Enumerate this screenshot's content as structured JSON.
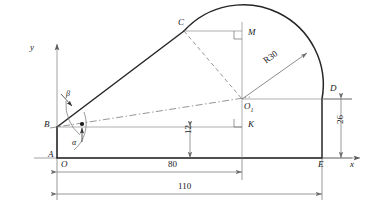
{
  "drawing": {
    "title": "Cam profile geometric construction",
    "axes": {
      "x_label": "x",
      "y_label": "y",
      "origin_label": "O"
    },
    "points": [
      {
        "id": "A",
        "label": "A",
        "x": 48,
        "y": 150
      },
      {
        "id": "B",
        "label": "B",
        "x": 44,
        "y": 120
      },
      {
        "id": "C",
        "label": "C",
        "x": 178,
        "y": 18
      },
      {
        "id": "M",
        "label": "M",
        "x": 248,
        "y": 28
      },
      {
        "id": "O1",
        "label": "O",
        "sub": "1",
        "x": 244,
        "y": 102
      },
      {
        "id": "K",
        "label": "K",
        "x": 248,
        "y": 120
      },
      {
        "id": "D",
        "label": "D",
        "x": 330,
        "y": 84
      },
      {
        "id": "E",
        "label": "E",
        "x": 318,
        "y": 160
      }
    ],
    "angles": [
      {
        "id": "alpha",
        "label": "α",
        "x": 72,
        "y": 139
      },
      {
        "id": "beta",
        "label": "β",
        "x": 66,
        "y": 90
      }
    ],
    "dimensions": [
      {
        "id": "dim-80",
        "value": "80",
        "x": 168,
        "y": 168,
        "orient": "horizontal"
      },
      {
        "id": "dim-110",
        "value": "110",
        "x": 178,
        "y": 190,
        "orient": "horizontal"
      },
      {
        "id": "dim-12",
        "value": "12",
        "x": 198,
        "y": 132,
        "orient": "vertical"
      },
      {
        "id": "dim-26",
        "value": "26",
        "x": 336,
        "y": 122,
        "orient": "vertical"
      },
      {
        "id": "dim-r30",
        "value": "R30",
        "x": 262,
        "y": 56,
        "orient": "rotated"
      }
    ],
    "colors": {
      "outline": "#262626",
      "thin": "#8c8c8c",
      "centerline": "#7a7a7a",
      "dim": "#6e6e6e",
      "text": "#1a1a1a"
    }
  }
}
